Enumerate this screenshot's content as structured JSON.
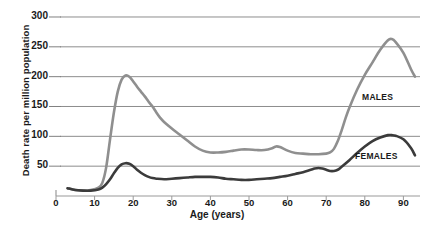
{
  "chart_data": {
    "type": "line",
    "title": "",
    "xlabel": "Age (years)",
    "ylabel": "Death rate per million population",
    "xlim": [
      0,
      95
    ],
    "ylim": [
      0,
      300
    ],
    "grid": true,
    "legend_position": "inline-annotations",
    "x_ticks": [
      0,
      10,
      20,
      30,
      40,
      50,
      60,
      70,
      80,
      90
    ],
    "y_ticks": [
      50,
      100,
      150,
      200,
      250,
      300
    ],
    "annotations": [
      {
        "text": "MALES",
        "x": 80,
        "y": 132
      },
      {
        "text": "FEMALES",
        "x": 78,
        "y": 70
      }
    ],
    "colors": {
      "males": "#8f8f8f",
      "females": "#3b3b3b",
      "grid": "#808080",
      "axis": "#9a9a9a"
    },
    "series": [
      {
        "name": "MALES",
        "color": "#8f8f8f",
        "x": [
          3,
          5,
          7,
          9,
          11,
          12,
          13,
          14,
          15,
          16,
          17,
          18,
          19,
          20,
          21,
          22,
          23,
          24,
          25,
          26,
          27,
          28,
          30,
          32,
          34,
          36,
          38,
          40,
          42,
          44,
          46,
          48,
          50,
          52,
          54,
          56,
          57,
          58,
          60,
          62,
          64,
          66,
          68,
          70,
          71,
          72,
          73,
          74,
          75,
          76,
          78,
          80,
          82,
          84,
          86,
          87,
          88,
          90,
          92,
          93
        ],
        "y": [
          13,
          10,
          9,
          10,
          14,
          22,
          48,
          95,
          140,
          175,
          195,
          202,
          200,
          192,
          183,
          175,
          167,
          158,
          150,
          140,
          131,
          124,
          113,
          103,
          93,
          83,
          76,
          73,
          73,
          74,
          76,
          78,
          78,
          77,
          77,
          80,
          83,
          82,
          76,
          72,
          71,
          70,
          70,
          71,
          73,
          79,
          92,
          110,
          130,
          148,
          178,
          203,
          224,
          245,
          261,
          263,
          258,
          240,
          212,
          200
        ]
      },
      {
        "name": "FEMALES",
        "color": "#3b3b3b",
        "x": [
          3,
          5,
          7,
          9,
          11,
          12,
          13,
          14,
          15,
          16,
          17,
          18,
          19,
          20,
          21,
          22,
          23,
          24,
          25,
          26,
          28,
          30,
          32,
          34,
          36,
          38,
          40,
          42,
          44,
          46,
          48,
          50,
          52,
          54,
          56,
          58,
          60,
          62,
          64,
          66,
          67,
          68,
          69,
          70,
          71,
          72,
          73,
          74,
          76,
          78,
          80,
          82,
          84,
          86,
          87,
          88,
          90,
          92,
          93
        ],
        "y": [
          13,
          10,
          9,
          9,
          11,
          14,
          20,
          28,
          38,
          47,
          53,
          55,
          54,
          50,
          44,
          39,
          35,
          32,
          30,
          29,
          28,
          29,
          30,
          31,
          32,
          32,
          32,
          31,
          29,
          28,
          27,
          27,
          28,
          29,
          30,
          32,
          34,
          37,
          40,
          44,
          46,
          47,
          46,
          44,
          42,
          42,
          44,
          49,
          60,
          72,
          83,
          92,
          98,
          102,
          102,
          101,
          95,
          80,
          68
        ]
      }
    ]
  },
  "axes": {
    "y_title": "Death rate per million population",
    "x_title": "Age (years)",
    "y_tick_labels": [
      "300",
      "250",
      "200",
      "150",
      "100",
      "50"
    ],
    "x_tick_labels": [
      "0",
      "10",
      "20",
      "30",
      "40",
      "50",
      "60",
      "70",
      "80",
      "90"
    ]
  },
  "labels": {
    "males": "MALES",
    "females": "FEMALES"
  }
}
